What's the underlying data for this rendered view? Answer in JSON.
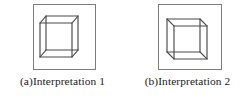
{
  "figure": {
    "type": "necker-cube-ambiguity-illustration",
    "panel_count": 2,
    "background_color": "#ffffff",
    "frame_color": "#7d7d7d",
    "line_color": "#4a4a4a"
  },
  "panels": [
    {
      "id": "a",
      "caption": "(a)Interpretation 1",
      "shape_name": "necker-cube",
      "frame": {
        "x": 33,
        "y": 4,
        "width": 63,
        "height": 66
      },
      "front_face": {
        "x": 40,
        "y": 23,
        "width": 32,
        "height": 34
      },
      "depth_offset": {
        "dx": 6,
        "dy": -7
      },
      "depth_direction": "back-face-up-right",
      "description": "Cube drawn with the nearer square face at lower-left"
    },
    {
      "id": "b",
      "caption": "(b)Interpretation 2",
      "shape_name": "necker-cube",
      "frame": {
        "x": 33,
        "y": 4,
        "width": 64,
        "height": 66
      },
      "front_face": {
        "x": 42,
        "y": 19,
        "width": 33,
        "height": 33
      },
      "depth_offset": {
        "dx": 7,
        "dy": 7
      },
      "depth_direction": "back-face-down-right",
      "description": "Cube drawn with the nearer square face at upper-left"
    }
  ]
}
